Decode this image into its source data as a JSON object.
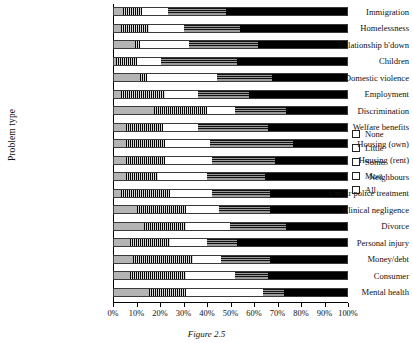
{
  "chart_data": {
    "type": "bar",
    "subtype": "stacked-horizontal-100-percent",
    "title": "",
    "caption": "Figure 2.5",
    "xlabel": "",
    "ylabel": "Problem type",
    "xlim": [
      0,
      100
    ],
    "xticks": [
      "0%",
      "10%",
      "20%",
      "30%",
      "40%",
      "50%",
      "60%",
      "70%",
      "80%",
      "90%",
      "100%"
    ],
    "grid": false,
    "legend_position": "right",
    "legend": [
      "None",
      "Little",
      "Some",
      "Most",
      "All"
    ],
    "series": [
      {
        "name": "None",
        "pattern": "solid-light-gray",
        "color": "#b4b4b4",
        "values": [
          4,
          3,
          9,
          1,
          11,
          3,
          17,
          5,
          5,
          5,
          5,
          3,
          10,
          13,
          7,
          8,
          7,
          15
        ]
      },
      {
        "name": "Little",
        "pattern": "vertical-stripes",
        "color": "#d8d8d8",
        "values": [
          8,
          12,
          2,
          9,
          3,
          19,
          23,
          16,
          17,
          17,
          14,
          21,
          21,
          18,
          17,
          26,
          24,
          16
        ]
      },
      {
        "name": "Some",
        "pattern": "white",
        "color": "#ffffff",
        "values": [
          11,
          15,
          21,
          10,
          30,
          14,
          12,
          15,
          19,
          20,
          21,
          18,
          14,
          19,
          16,
          12,
          21,
          33
        ]
      },
      {
        "name": "Most",
        "pattern": "horizontal-stripes",
        "color": "#9a9a9a",
        "values": [
          25,
          24,
          30,
          33,
          24,
          22,
          22,
          30,
          36,
          27,
          25,
          25,
          22,
          24,
          13,
          21,
          14,
          9
        ]
      },
      {
        "name": "All",
        "pattern": "solid-black",
        "color": "#000000",
        "values": [
          52,
          46,
          38,
          47,
          32,
          42,
          26,
          34,
          23,
          31,
          35,
          33,
          33,
          26,
          47,
          33,
          34,
          27
        ]
      }
    ],
    "categories": [
      "Immigration",
      "Homelessness",
      "Relationship b'down",
      "Children",
      "Domestic violence",
      "Employment",
      "Discrimination",
      "Welfare benefits",
      "Housing (own)",
      "Housing (rent)",
      "Neighbours",
      "Unfair police treatment",
      "Clinical negligence",
      "Divorce",
      "Personal injury",
      "Money/debt",
      "Consumer",
      "Mental health"
    ]
  }
}
